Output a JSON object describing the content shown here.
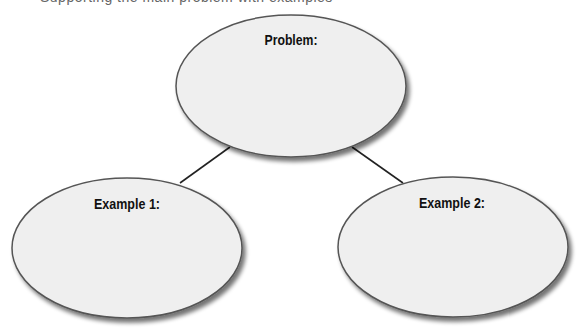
{
  "page": {
    "top_clipped_text": "Supporting the main problem with examples"
  },
  "diagram": {
    "type": "concept-web",
    "colors": {
      "fill": "#efefef",
      "stroke": "#555555",
      "line": "#222222",
      "shadow": "#888888"
    },
    "nodes": [
      {
        "id": "problem",
        "label": "Problem:",
        "cx": 291,
        "cy": 86,
        "rx": 115,
        "ry": 71,
        "label_x": 291,
        "label_y": 45
      },
      {
        "id": "example1",
        "label": "Example 1:",
        "cx": 127,
        "cy": 248,
        "rx": 115,
        "ry": 70,
        "label_x": 127,
        "label_y": 209
      },
      {
        "id": "example2",
        "label": "Example 2:",
        "cx": 453,
        "cy": 247,
        "rx": 115,
        "ry": 70,
        "label_x": 452,
        "label_y": 208
      }
    ],
    "edges": [
      {
        "from": "problem",
        "to": "example1",
        "x1": 230,
        "y1": 147,
        "x2": 180,
        "y2": 183
      },
      {
        "from": "problem",
        "to": "example2",
        "x1": 352,
        "y1": 147,
        "x2": 403,
        "y2": 183
      }
    ]
  }
}
